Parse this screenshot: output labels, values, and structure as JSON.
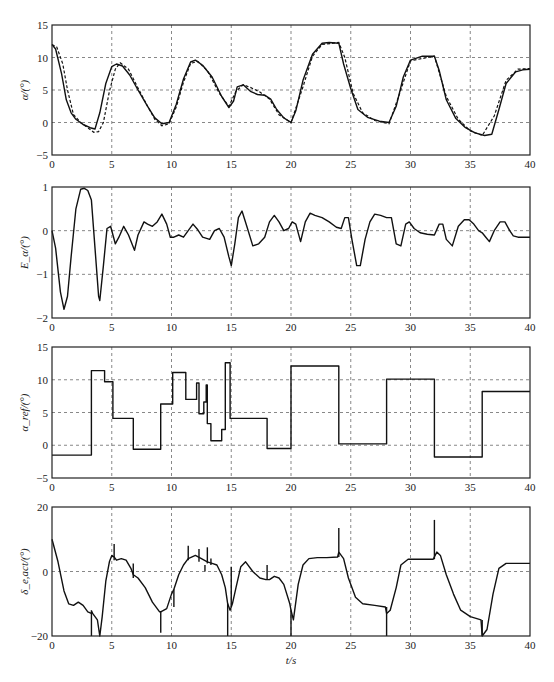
{
  "figure": {
    "xlabel": "t/s",
    "caption": "",
    "xlim": [
      0,
      40
    ],
    "xticks": [
      0,
      5,
      10,
      15,
      20,
      25,
      30,
      35,
      40
    ]
  },
  "chart_data": [
    {
      "type": "line",
      "title": "",
      "ylabel": "α/(°)",
      "xlabel": "t/s",
      "ylim": [
        -5,
        15
      ],
      "yticks": [
        -5,
        0,
        5,
        10,
        15
      ],
      "grid": true,
      "series": [
        {
          "name": "α (solid)",
          "style": "solid",
          "x": [
            0,
            0.3,
            0.8,
            1.2,
            1.6,
            2.0,
            2.6,
            3.2,
            3.6,
            4.0,
            4.5,
            5.0,
            5.4,
            5.9,
            6.5,
            7.2,
            8.0,
            8.6,
            9.2,
            9.8,
            10.4,
            11.0,
            11.6,
            12.0,
            12.6,
            13.4,
            14.2,
            14.8,
            15.2,
            15.5,
            16.0,
            16.6,
            17.2,
            17.8,
            18.3,
            18.8,
            19.4,
            20.0,
            20.4,
            21.0,
            21.8,
            22.6,
            23.2,
            24.0,
            24.4,
            25.0,
            25.6,
            26.4,
            27.4,
            28.2,
            28.8,
            29.4,
            30.0,
            31.0,
            32.0,
            32.4,
            33.0,
            33.8,
            34.6,
            35.4,
            36.2,
            36.8,
            37.4,
            38.0,
            38.8,
            39.4,
            40
          ],
          "y": [
            12,
            11.3,
            7.5,
            3.5,
            1.5,
            0.5,
            -0.3,
            -0.8,
            -1.0,
            1.5,
            6.0,
            8.6,
            9.0,
            8.7,
            7.3,
            5.0,
            2.5,
            0.7,
            -0.2,
            0,
            2.8,
            6.7,
            9.3,
            9.6,
            8.8,
            7.0,
            4.0,
            2.3,
            3.3,
            5.5,
            5.8,
            4.8,
            4.3,
            4.2,
            3.6,
            2.0,
            0.7,
            0,
            1.8,
            6.5,
            10.5,
            12.2,
            12.3,
            12.2,
            9.0,
            5.2,
            2.0,
            0.8,
            0.2,
            0,
            2.5,
            7.0,
            9.6,
            10.2,
            10.2,
            8.0,
            3.5,
            0.6,
            -0.8,
            -1.6,
            -2.0,
            -1.8,
            2.0,
            6.0,
            7.8,
            8.1,
            8.2
          ]
        },
        {
          "name": "α (dashed)",
          "style": "dashed",
          "x": [
            0,
            0.4,
            0.9,
            1.3,
            1.8,
            2.4,
            3.0,
            3.5,
            3.9,
            4.3,
            4.8,
            5.3,
            5.7,
            6.4,
            7.2,
            8.0,
            8.6,
            9.2,
            9.8,
            10.4,
            11.0,
            11.6,
            12.2,
            13.0,
            14.0,
            14.8,
            15.4,
            16.0,
            16.6,
            17.4,
            18.2,
            19.0,
            20.0,
            21.0,
            21.8,
            22.6,
            24.0,
            24.5,
            25.2,
            26.0,
            27.0,
            28.2,
            29.0,
            30.0,
            32.0,
            33.0,
            34.0,
            35.0,
            36.0,
            37.0,
            38.0,
            39.0,
            40
          ],
          "y": [
            12,
            11.6,
            9.0,
            5.0,
            1.2,
            0,
            -0.8,
            -1.5,
            -1.4,
            0,
            4.8,
            8.2,
            9.2,
            8.2,
            5.3,
            2.5,
            0.5,
            -0.5,
            -0.2,
            2.4,
            6.2,
            9.1,
            9.4,
            8.0,
            4.5,
            2.5,
            4.8,
            5.8,
            5.4,
            4.7,
            3.6,
            1.2,
            0,
            5.5,
            10.2,
            12.0,
            12.3,
            10.0,
            4.5,
            1.5,
            0.3,
            -0.2,
            4.0,
            9.5,
            10.2,
            4.0,
            0.5,
            -1.3,
            -2.0,
            1.0,
            6.5,
            8.2,
            8.3
          ]
        }
      ]
    },
    {
      "type": "line",
      "title": "",
      "ylabel": "E_α/(°)",
      "xlabel": "t/s",
      "ylim": [
        -2,
        1
      ],
      "yticks": [
        -2,
        -1,
        0,
        1
      ],
      "grid": true,
      "series": [
        {
          "name": "E_α",
          "style": "solid",
          "x": [
            0,
            0.3,
            0.7,
            1.0,
            1.3,
            1.6,
            2.0,
            2.4,
            2.7,
            3.0,
            3.3,
            3.6,
            3.9,
            4.0,
            4.3,
            4.6,
            4.9,
            5.3,
            5.6,
            6.0,
            6.4,
            6.9,
            7.2,
            7.7,
            8.0,
            8.4,
            8.8,
            9.2,
            9.6,
            9.9,
            10.2,
            10.6,
            11.0,
            11.4,
            11.8,
            12.2,
            12.6,
            13.2,
            13.6,
            14.0,
            14.4,
            14.8,
            15.0,
            15.3,
            15.6,
            15.9,
            16.3,
            16.8,
            17.3,
            17.8,
            18.2,
            18.6,
            19.0,
            19.4,
            19.8,
            20.1,
            20.4,
            20.8,
            21.2,
            21.6,
            22.0,
            22.6,
            23.2,
            23.8,
            24.2,
            24.5,
            24.8,
            25.1,
            25.5,
            25.8,
            26.2,
            26.6,
            27.0,
            27.5,
            28.0,
            28.4,
            28.8,
            29.2,
            29.6,
            29.9,
            30.3,
            30.8,
            31.4,
            32.0,
            32.4,
            32.7,
            33.0,
            33.5,
            34.0,
            34.5,
            34.9,
            35.3,
            35.7,
            36.0,
            36.3,
            36.6,
            37.0,
            37.5,
            37.9,
            38.3,
            38.6,
            39.0,
            39.5,
            40
          ],
          "y": [
            0,
            -0.4,
            -1.4,
            -1.8,
            -1.5,
            -0.6,
            0.5,
            0.95,
            0.97,
            0.92,
            0.7,
            -0.4,
            -1.5,
            -1.6,
            -0.8,
            0.05,
            0.1,
            -0.3,
            -0.15,
            0.1,
            -0.1,
            -0.45,
            -0.1,
            0.2,
            0.15,
            0.1,
            0.2,
            0.38,
            0.15,
            -0.15,
            -0.15,
            -0.1,
            -0.15,
            0,
            0.15,
            0.02,
            -0.15,
            -0.2,
            0,
            0.05,
            -0.15,
            -0.6,
            -0.8,
            -0.3,
            0.3,
            0.45,
            0.1,
            -0.35,
            -0.3,
            -0.15,
            0.2,
            0.35,
            0.2,
            0,
            0.05,
            0.2,
            0.15,
            -0.25,
            0.2,
            0.4,
            0.35,
            0.3,
            0.2,
            0.08,
            0.05,
            0.3,
            0.3,
            -0.2,
            -0.8,
            -0.8,
            -0.2,
            0.2,
            0.38,
            0.35,
            0.3,
            0.3,
            -0.3,
            -0.35,
            0.15,
            0.2,
            0.05,
            -0.05,
            -0.08,
            -0.1,
            0.15,
            0.15,
            -0.2,
            -0.35,
            0.1,
            0.25,
            0.25,
            0.15,
            0,
            -0.05,
            -0.15,
            -0.25,
            0,
            0.2,
            0.2,
            0,
            -0.12,
            -0.15,
            -0.15,
            -0.15
          ]
        }
      ]
    },
    {
      "type": "line",
      "title": "",
      "ylabel": "α_ref/(°)",
      "xlabel": "t/s",
      "ylim": [
        -5,
        15
      ],
      "yticks": [
        -5,
        0,
        5,
        10,
        15
      ],
      "grid": true,
      "step": true,
      "series": [
        {
          "name": "α_ref",
          "style": "step",
          "x": [
            0,
            3.3,
            3.3,
            4.4,
            4.4,
            5.1,
            5.1,
            6.8,
            6.8,
            9.1,
            9.1,
            10.1,
            10.1,
            11.2,
            11.2,
            12.1,
            12.1,
            12.3,
            12.3,
            12.7,
            12.7,
            12.9,
            12.9,
            13.0,
            13.0,
            13.3,
            13.3,
            14.2,
            14.2,
            14.5,
            14.5,
            14.9,
            14.9,
            18.0,
            18.0,
            20.0,
            20.0,
            24.0,
            24.0,
            28.0,
            28.0,
            32.0,
            32.0,
            36.0,
            36.0,
            40
          ],
          "y": [
            -1.5,
            -1.5,
            11.4,
            11.4,
            9.7,
            9.7,
            4.1,
            4.1,
            -0.6,
            -0.6,
            6.3,
            6.3,
            11.1,
            11.1,
            7.0,
            7.0,
            9.5,
            9.5,
            4.8,
            4.8,
            6.6,
            6.6,
            9.2,
            9.2,
            3.3,
            3.3,
            0.7,
            0.7,
            2.4,
            2.4,
            12.6,
            12.6,
            4.1,
            4.1,
            -0.5,
            -0.5,
            12.1,
            12.1,
            0.2,
            0.2,
            10.1,
            10.1,
            -1.8,
            -1.8,
            8.2,
            8.2
          ]
        }
      ]
    },
    {
      "type": "line",
      "title": "",
      "ylabel": "δ_e,act/(°)",
      "xlabel": "t/s",
      "ylim": [
        -20,
        20
      ],
      "yticks": [
        -20,
        0,
        20
      ],
      "grid": true,
      "series": [
        {
          "name": "δ_e,act",
          "style": "solid",
          "x": [
            0,
            0.5,
            1.0,
            1.4,
            1.8,
            2.2,
            2.6,
            3.0,
            3.3,
            3.35,
            3.4,
            3.8,
            4.0,
            4.2,
            4.5,
            4.8,
            5.0,
            5.2,
            5.4,
            5.8,
            6.2,
            6.6,
            6.8,
            7.2,
            7.8,
            8.4,
            9.0,
            9.1,
            9.6,
            10.0,
            10.2,
            10.6,
            11.0,
            11.4,
            12.0,
            12.5,
            13.0,
            13.4,
            13.8,
            14.2,
            14.5,
            14.7,
            14.9,
            15.1,
            15.4,
            15.8,
            16.2,
            16.8,
            17.4,
            17.9,
            18.2,
            18.6,
            19.0,
            19.4,
            19.9,
            20.0,
            20.2,
            20.6,
            21.0,
            21.5,
            22.2,
            23.0,
            23.9,
            24.0,
            24.4,
            24.8,
            25.4,
            26.0,
            27.0,
            27.9,
            28.0,
            28.3,
            28.8,
            29.2,
            29.8,
            30.5,
            31.5,
            31.9,
            32.2,
            32.5,
            33.0,
            33.6,
            34.2,
            35.0,
            35.9,
            36.0,
            36.4,
            36.9,
            37.4,
            38.0,
            39.0,
            40
          ],
          "y": [
            10,
            3,
            -6,
            -10,
            -10.5,
            -9.5,
            -10.5,
            -12.5,
            -13,
            -12.5,
            -13,
            -15,
            -20,
            -14,
            -3,
            3,
            5,
            4.5,
            3.5,
            4,
            3.5,
            1,
            -1,
            -2,
            -5,
            -9.5,
            -12.5,
            -12.5,
            -11.5,
            -7,
            -5.5,
            -1,
            2,
            4,
            5,
            4,
            3,
            2.5,
            2,
            -1,
            -5,
            -10,
            -12,
            -10,
            -5,
            1.5,
            3,
            0,
            -2,
            -2.5,
            -2.5,
            -1.5,
            -2,
            -4,
            -10,
            -12,
            -15,
            -4,
            2,
            4,
            4.3,
            4.3,
            4.5,
            6,
            4,
            -2,
            -8,
            -10,
            -10.5,
            -11,
            -13,
            -12,
            -5,
            2,
            3.8,
            3.8,
            3.8,
            3.8,
            6,
            5,
            -1,
            -7,
            -12,
            -14,
            -15,
            -20,
            -18,
            -7,
            1,
            2.5,
            2.5,
            2.5
          ]
        },
        {
          "name": "spikes",
          "style": "spikes",
          "points": [
            [
              3.3,
              -12,
              -20
            ],
            [
              5.2,
              3.5,
              8.5
            ],
            [
              6.8,
              -2,
              2.5
            ],
            [
              9.1,
              -12.5,
              -19
            ],
            [
              10.2,
              -5.5,
              -11
            ],
            [
              11.4,
              3.5,
              8
            ],
            [
              12.3,
              3.0,
              7
            ],
            [
              12.8,
              2.0,
              0
            ],
            [
              13.0,
              2.5,
              7.5
            ],
            [
              13.3,
              2.0,
              4
            ],
            [
              14.7,
              -10,
              -20
            ],
            [
              15.0,
              -11,
              1.5
            ],
            [
              18.0,
              -2.5,
              2
            ],
            [
              20.0,
              -12,
              -20
            ],
            [
              24.0,
              4.5,
              13.5
            ],
            [
              28.0,
              -11,
              -20
            ],
            [
              32.0,
              3.8,
              16
            ],
            [
              36.0,
              -15,
              -20
            ]
          ]
        }
      ]
    }
  ]
}
